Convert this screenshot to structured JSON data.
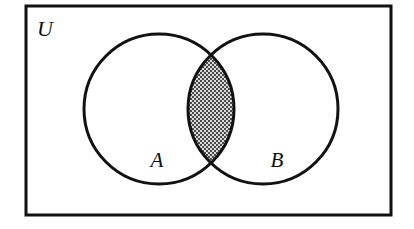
{
  "figure": {
    "kind": "venn-diagram",
    "caption_labels": {
      "universe": "U",
      "set_a": "A",
      "set_b": "B"
    },
    "colors": {
      "background": "#ffffff",
      "stroke": "#111111",
      "hatch_dark": "#4a4a4a",
      "hatch_light": "#d9d9d9",
      "label": "#0d0d0d"
    },
    "universe_rect": {
      "label": "U",
      "x": 26,
      "y": 6,
      "width": 365,
      "height": 209,
      "stroke_width": 3
    },
    "circles": [
      {
        "label": "A",
        "cx": 159,
        "cy": 109,
        "r": 75,
        "stroke_width": 3,
        "label_x": 157,
        "label_y": 167
      },
      {
        "label": "B",
        "cx": 263,
        "cy": 109,
        "r": 75,
        "stroke_width": 3,
        "label_x": 277,
        "label_y": 167
      }
    ],
    "shaded_region": {
      "name": "intersection",
      "notation": "A ∩ B",
      "fill_pattern": "checkerboard-hatch",
      "pattern_cell_px": 2,
      "top_x": 211,
      "top_y": 58,
      "bottom_x": 211,
      "bottom_y": 161,
      "left_x": 188,
      "right_x": 234
    },
    "label_font_size": 21,
    "universe_label_x": 37,
    "universe_label_y": 36,
    "universe_label_font_size": 22
  }
}
